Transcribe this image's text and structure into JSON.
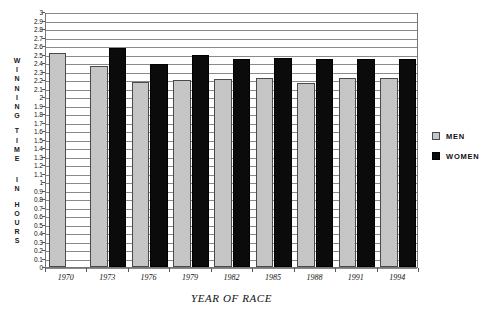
{
  "chart_data": {
    "type": "bar",
    "title": "",
    "xlabel": "YEAR OF RACE",
    "ylabel": "WINNING TIME IN HOURS",
    "categories": [
      "1970",
      "1973",
      "1976",
      "1979",
      "1982",
      "1985",
      "1988",
      "1991",
      "1994"
    ],
    "series": [
      {
        "name": "MEN",
        "color": "#c6c6c6",
        "values": [
          2.52,
          2.37,
          2.18,
          2.2,
          2.21,
          2.22,
          2.16,
          2.22,
          2.22
        ]
      },
      {
        "name": "WOMEN",
        "color": "#0b0b0b",
        "values": [
          null,
          2.58,
          2.39,
          2.5,
          2.45,
          2.46,
          2.45,
          2.45,
          2.45
        ]
      }
    ],
    "ylim": [
      0,
      3
    ],
    "ytick_step": 0.1,
    "ytick_labels": [
      "3",
      "2.9",
      "2.8",
      "2.7",
      "2.6",
      "2.5",
      "2.4",
      "2.3",
      "2.2",
      "2.1",
      "2",
      "1.9",
      "1.8",
      "1.7",
      "1.6",
      "1.5",
      "1.4",
      "1.3",
      "1.2",
      "1.1",
      "1",
      "0.9",
      "0.8",
      "0.7",
      "0.6",
      "0.5",
      "0.4",
      "0.3",
      "0.2",
      "0.1",
      "0"
    ],
    "grid": true,
    "legend_position": "right",
    "legend": [
      {
        "label": "MEN",
        "swatch": "men"
      },
      {
        "label": "WOMEN",
        "swatch": "women"
      }
    ]
  },
  "axis_titles": {
    "y_letters": [
      "W",
      "I",
      "N",
      "N",
      "I",
      "N",
      "G",
      "",
      "T",
      "I",
      "M",
      "E",
      "",
      "",
      "I",
      "N",
      "",
      "H",
      "O",
      "U",
      "R",
      "S"
    ],
    "x": "YEAR OF RACE"
  }
}
